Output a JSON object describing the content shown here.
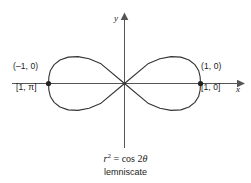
{
  "figure": {
    "background_color": "#ffffff",
    "stroke_color": "#333333",
    "axis_color": "#555555",
    "point_color": "#222222",
    "axes": {
      "x_label": "x",
      "y_label": "y"
    },
    "labels": {
      "left_cartesian": "(–1, 0)",
      "left_polar": "[1, π]",
      "right_cartesian": "(1, 0)",
      "right_polar": "[1, 0]"
    },
    "caption": {
      "equation_var": "r",
      "equation_exponent": "2",
      "equation_rest": " = cos 2",
      "equation_theta": "θ",
      "name": "lemniscate"
    }
  },
  "chart_data": {
    "type": "line",
    "title": "",
    "subtitle": "lemniscate",
    "equation": "r^2 = cos 2θ",
    "curve_name": "lemniscate of Bernoulli",
    "polar": true,
    "xlabel": "x",
    "ylabel": "y",
    "grid": false,
    "legend": null,
    "xlim": [
      -1.9,
      1.55
    ],
    "ylim": [
      -1.05,
      1.3
    ],
    "annotations": [
      {
        "text": "(–1, 0)",
        "x": -1.0,
        "y": 0.0,
        "kind": "cartesian-vertex-label"
      },
      {
        "text": "[1, π]",
        "x": -1.0,
        "y": 0.0,
        "kind": "polar-vertex-label"
      },
      {
        "text": "(1, 0)",
        "x": 1.0,
        "y": 0.0,
        "kind": "cartesian-vertex-label"
      },
      {
        "text": "[1, 0]",
        "x": 1.0,
        "y": 0.0,
        "kind": "polar-vertex-label"
      }
    ],
    "marked_points": [
      {
        "x": -1.0,
        "y": 0.0
      },
      {
        "x": 1.0,
        "y": 0.0
      }
    ],
    "series": [
      {
        "name": "r^2 = cos 2θ",
        "points": [
          {
            "theta": -0.785398,
            "r": 0.0,
            "x": 0.0,
            "y": 0.0
          },
          {
            "theta": -0.698132,
            "r": 0.412,
            "x": 0.316,
            "y": -0.264
          },
          {
            "theta": -0.610865,
            "r": 0.567,
            "x": 0.466,
            "y": -0.325
          },
          {
            "theta": -0.523599,
            "r": 0.707,
            "x": 0.612,
            "y": -0.354
          },
          {
            "theta": -0.436332,
            "r": 0.818,
            "x": 0.741,
            "y": -0.347
          },
          {
            "theta": -0.349066,
            "r": 0.903,
            "x": 0.849,
            "y": -0.309
          },
          {
            "theta": -0.261799,
            "r": 0.959,
            "x": 0.926,
            "y": -0.248
          },
          {
            "theta": -0.174533,
            "r": 0.99,
            "x": 0.975,
            "y": -0.172
          },
          {
            "theta": -0.087266,
            "r": 0.999,
            "x": 0.995,
            "y": -0.087
          },
          {
            "theta": 0.0,
            "r": 1.0,
            "x": 1.0,
            "y": 0.0
          },
          {
            "theta": 0.087266,
            "r": 0.999,
            "x": 0.995,
            "y": 0.087
          },
          {
            "theta": 0.174533,
            "r": 0.99,
            "x": 0.975,
            "y": 0.172
          },
          {
            "theta": 0.261799,
            "r": 0.959,
            "x": 0.926,
            "y": 0.248
          },
          {
            "theta": 0.349066,
            "r": 0.903,
            "x": 0.849,
            "y": 0.309
          },
          {
            "theta": 0.436332,
            "r": 0.818,
            "x": 0.741,
            "y": 0.347
          },
          {
            "theta": 0.523599,
            "r": 0.707,
            "x": 0.612,
            "y": 0.354
          },
          {
            "theta": 0.610865,
            "r": 0.567,
            "x": 0.466,
            "y": 0.325
          },
          {
            "theta": 0.698132,
            "r": 0.412,
            "x": 0.316,
            "y": 0.264
          },
          {
            "theta": 0.785398,
            "r": 0.0,
            "x": 0.0,
            "y": 0.0
          },
          {
            "theta": 2.356194,
            "r": 0.0,
            "x": 0.0,
            "y": 0.0
          },
          {
            "theta": 2.443461,
            "r": 0.412,
            "x": -0.316,
            "y": 0.264
          },
          {
            "theta": 2.530727,
            "r": 0.567,
            "x": -0.466,
            "y": 0.325
          },
          {
            "theta": 2.617994,
            "r": 0.707,
            "x": -0.612,
            "y": 0.354
          },
          {
            "theta": 2.70526,
            "r": 0.818,
            "x": -0.741,
            "y": 0.347
          },
          {
            "theta": 2.792527,
            "r": 0.903,
            "x": -0.849,
            "y": 0.309
          },
          {
            "theta": 2.879793,
            "r": 0.959,
            "x": -0.926,
            "y": 0.248
          },
          {
            "theta": 2.96706,
            "r": 0.99,
            "x": -0.975,
            "y": 0.172
          },
          {
            "theta": 3.054326,
            "r": 0.999,
            "x": -0.995,
            "y": 0.087
          },
          {
            "theta": 3.141593,
            "r": 1.0,
            "x": -1.0,
            "y": 0.0
          },
          {
            "theta": 3.228859,
            "r": 0.999,
            "x": -0.995,
            "y": -0.087
          },
          {
            "theta": 3.316126,
            "r": 0.99,
            "x": -0.975,
            "y": -0.172
          },
          {
            "theta": 3.403392,
            "r": 0.959,
            "x": -0.926,
            "y": -0.248
          },
          {
            "theta": 3.490659,
            "r": 0.903,
            "x": -0.849,
            "y": -0.309
          },
          {
            "theta": 3.577925,
            "r": 0.818,
            "x": -0.741,
            "y": -0.347
          },
          {
            "theta": 3.665191,
            "r": 0.707,
            "x": -0.612,
            "y": -0.354
          },
          {
            "theta": 3.752458,
            "r": 0.567,
            "x": -0.466,
            "y": -0.325
          },
          {
            "theta": 3.839724,
            "r": 0.412,
            "x": -0.316,
            "y": -0.264
          },
          {
            "theta": 3.926991,
            "r": 0.0,
            "x": 0.0,
            "y": 0.0
          }
        ]
      }
    ]
  }
}
